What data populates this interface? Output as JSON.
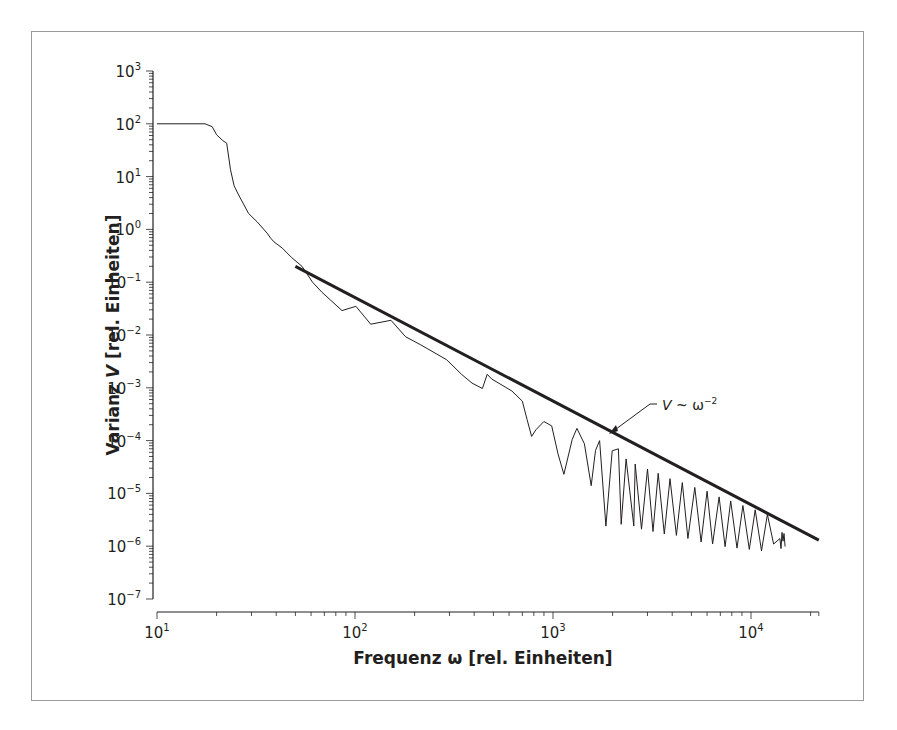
{
  "chart_data": {
    "type": "line",
    "title": "",
    "xlabel": "Frequenz ω [rel. Einheiten]",
    "ylabel": "Varianz V [rel. Einheiten]",
    "xscale": "log",
    "yscale": "log",
    "xlim": [
      10,
      22000
    ],
    "ylim": [
      1e-07,
      1000
    ],
    "grid": false,
    "legend": null,
    "x_ticks": [
      {
        "base": "10",
        "exp": "1",
        "value": 10
      },
      {
        "base": "10",
        "exp": "2",
        "value": 100
      },
      {
        "base": "10",
        "exp": "3",
        "value": 1000
      },
      {
        "base": "10",
        "exp": "4",
        "value": 10000
      }
    ],
    "y_ticks": [
      {
        "base": "10",
        "exp": "3",
        "value": 1000
      },
      {
        "base": "10",
        "exp": "2",
        "value": 100
      },
      {
        "base": "10",
        "exp": "1",
        "value": 10
      },
      {
        "base": "10",
        "exp": "0",
        "value": 1
      },
      {
        "base": "10",
        "exp": "−1",
        "value": 0.1
      },
      {
        "base": "10",
        "exp": "−2",
        "value": 0.01
      },
      {
        "base": "10",
        "exp": "−3",
        "value": 0.001
      },
      {
        "base": "10",
        "exp": "−4",
        "value": 0.0001
      },
      {
        "base": "10",
        "exp": "−5",
        "value": 1e-05
      },
      {
        "base": "10",
        "exp": "−6",
        "value": 1e-06
      },
      {
        "base": "10",
        "exp": "−7",
        "value": 1e-07
      }
    ],
    "series": [
      {
        "name": "Varianz (gemessen)",
        "style": "thin",
        "x": [
          10,
          17.5,
          19,
          20,
          21.5,
          22.5,
          23.5,
          24.5,
          26,
          29,
          32,
          36,
          37.5,
          39,
          43,
          48,
          54,
          61,
          68,
          86,
          101,
          120,
          152,
          180,
          215,
          290,
          345,
          390,
          440,
          465,
          490,
          620,
          700,
          740,
          780,
          820,
          900,
          985,
          1060,
          1135,
          1250,
          1320,
          1440,
          1560,
          1640,
          1720,
          1850,
          1990,
          2140,
          2210,
          2340,
          2560,
          2600,
          2800,
          3000,
          3200,
          3400,
          3650,
          3900,
          4200,
          4500,
          4800,
          5200,
          5600,
          6000,
          6400,
          6900,
          7400,
          7900,
          8500,
          9100,
          9800,
          10500,
          11300,
          12100,
          13000,
          14000
        ],
        "y": [
          100,
          100,
          88,
          62,
          48,
          43,
          13.5,
          6.7,
          4.3,
          2.0,
          1.4,
          0.85,
          0.68,
          0.58,
          0.44,
          0.29,
          0.2,
          0.1,
          0.065,
          0.029,
          0.035,
          0.016,
          0.019,
          0.0093,
          0.0065,
          0.0034,
          0.0018,
          0.00123,
          0.00097,
          0.0018,
          0.00147,
          0.00087,
          0.00056,
          0.00025,
          0.00012,
          0.00016,
          0.00023,
          0.00019,
          5.6e-05,
          2.3e-05,
          0.000105,
          0.00017,
          8.7e-05,
          1.4e-05,
          6.5e-05,
          0.0001,
          2.4e-06,
          6.4e-05,
          7e-05,
          2.6e-06,
          4.5e-05,
          2.4e-06,
          3.6e-05,
          2.1e-06,
          2.9e-05,
          1.9e-06,
          2.4e-05,
          1.7e-06,
          1.9e-05,
          1.6e-06,
          1.6e-05,
          1.4e-06,
          1.3e-05,
          1.2e-06,
          1.1e-05,
          1.1e-06,
          8.6e-06,
          9.8e-07,
          7.2e-06,
          9.2e-07,
          5.9e-06,
          8.7e-07,
          4.9e-06,
          8.2e-07,
          4e-06,
          1.1e-06,
          1.4e-06
        ]
      },
      {
        "name": "V ~ ω^-2 (Fit)",
        "style": "thick",
        "x": [
          50,
          22000
        ],
        "y": [
          0.2,
          1.3e-06
        ]
      }
    ],
    "annotations": [
      {
        "text_main": "V ~ ω",
        "text_exp": "−2",
        "x": 680,
        "y": 0.00042,
        "arrow_to_x": 1220,
        "arrow_to_y": 0.00018
      }
    ]
  },
  "axes": {
    "x_title_main": "Frequenz ω [rel. Einheiten]",
    "y_title_prefix": "Varianz ",
    "y_title_var": "V",
    "y_title_suffix": " [rel. Einheiten]"
  },
  "annotation": {
    "label_var": "V",
    "label_op": " ~ ω",
    "label_exp": "−2"
  },
  "colors": {
    "line": "#231f20",
    "frame": "#9a9a9a",
    "background": "#ffffff"
  }
}
